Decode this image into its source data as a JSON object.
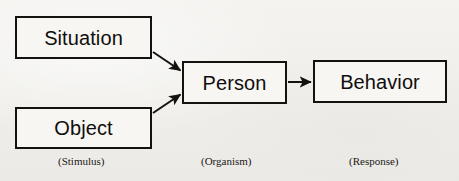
{
  "diagram": {
    "background_color": "#f2f1ee",
    "stroke_color": "#14120f",
    "nodes": {
      "situation": {
        "label": "Situation"
      },
      "object": {
        "label": "Object"
      },
      "person": {
        "label": "Person"
      },
      "behavior": {
        "label": "Behavior"
      }
    },
    "captions": {
      "stimulus": "(Stimulus)",
      "organism": "(Organism)",
      "response": "(Response)"
    },
    "connectors": [
      {
        "name": "situation-to-person",
        "from": "situation",
        "to": "person",
        "style": "diagonal-arrow"
      },
      {
        "name": "object-to-person",
        "from": "object",
        "to": "person",
        "style": "diagonal-arrow"
      },
      {
        "name": "person-to-behavior",
        "from": "person",
        "to": "behavior",
        "style": "horizontal-arrow"
      }
    ]
  }
}
